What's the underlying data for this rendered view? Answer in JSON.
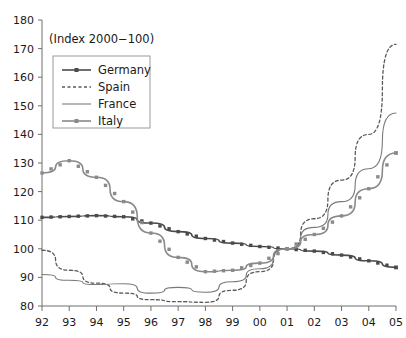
{
  "annotation": {
    "index_note": "(Index 2000−100)"
  },
  "legend": {
    "position": "top-left-inside",
    "entries": [
      {
        "label": "Germany",
        "style": "solid-with-square-markers",
        "color": "#4a4a4a"
      },
      {
        "label": "Spain",
        "style": "dashed",
        "color": "#5a5a5a"
      },
      {
        "label": "France",
        "style": "solid-thin",
        "color": "#7a7a7a"
      },
      {
        "label": "Italy",
        "style": "solid-with-square-markers",
        "color": "#8a8a8a"
      }
    ]
  },
  "chart_data": {
    "type": "line",
    "title": "",
    "subtitle": "",
    "xlabel": "",
    "ylabel": "",
    "annotation": "(Index 2000−100)",
    "grid": false,
    "legend_position": "top-left-inside",
    "x": [
      "92",
      "93",
      "94",
      "95",
      "96",
      "97",
      "98",
      "99",
      "00",
      "01",
      "02",
      "03",
      "04",
      "05"
    ],
    "xlim": [
      0,
      13
    ],
    "ylim": [
      80,
      180
    ],
    "yticks": [
      80,
      90,
      100,
      110,
      120,
      130,
      140,
      150,
      160,
      170,
      180
    ],
    "xticks": [
      "92",
      "93",
      "94",
      "95",
      "96",
      "97",
      "98",
      "99",
      "00",
      "01",
      "02",
      "03",
      "04",
      "05"
    ],
    "series": [
      {
        "name": "Germany",
        "color": "#4a4a4a",
        "dash": "none",
        "marker": "square",
        "values": [
          111.0,
          111.3,
          111.6,
          111.2,
          109.0,
          106.0,
          103.6,
          102.0,
          100.8,
          100.0,
          99.2,
          97.8,
          95.8,
          93.5
        ]
      },
      {
        "name": "Spain",
        "color": "#5a5a5a",
        "dash": "dashed",
        "marker": "none",
        "values": [
          99.5,
          92.5,
          88.0,
          84.5,
          82.2,
          81.5,
          81.3,
          85.5,
          92.0,
          100.0,
          110.5,
          124.0,
          140.0,
          171.5
        ]
      },
      {
        "name": "France",
        "color": "#7a7a7a",
        "dash": "none",
        "marker": "none",
        "values": [
          91.0,
          89.0,
          87.5,
          87.8,
          84.5,
          86.5,
          84.8,
          88.5,
          93.0,
          100.0,
          107.5,
          116.5,
          128.0,
          147.5
        ]
      },
      {
        "name": "Italy",
        "color": "#8a8a8a",
        "dash": "none",
        "marker": "square",
        "values": [
          126.5,
          130.8,
          125.0,
          116.5,
          105.5,
          97.0,
          92.0,
          92.5,
          95.0,
          100.0,
          105.0,
          111.5,
          121.0,
          133.5
        ]
      }
    ]
  }
}
